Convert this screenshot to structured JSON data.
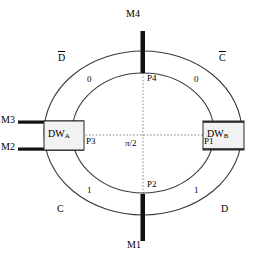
{
  "diagram": {
    "center_label": "π/2",
    "quadrant_labels": [
      {
        "name": "top-left-quadrant-label",
        "text": "D",
        "overline": true
      },
      {
        "name": "top-right-quadrant-label",
        "text": "C",
        "overline": true
      },
      {
        "name": "bottom-left-quadrant-label",
        "text": "C",
        "overline": false
      },
      {
        "name": "bottom-right-quadrant-label",
        "text": "D",
        "overline": false
      }
    ],
    "bit_labels": [
      {
        "name": "bit-top-left",
        "text": "0"
      },
      {
        "name": "bit-top-right",
        "text": "0"
      },
      {
        "name": "bit-bottom-left",
        "text": "1"
      },
      {
        "name": "bit-bottom-right",
        "text": "1"
      }
    ],
    "points": [
      {
        "name": "point-p1",
        "text": "P1"
      },
      {
        "name": "point-p2",
        "text": "P2"
      },
      {
        "name": "point-p3",
        "text": "P3"
      },
      {
        "name": "point-p4",
        "text": "P4"
      }
    ],
    "magnet_labels": [
      {
        "name": "magnet-m1",
        "text": "M1"
      },
      {
        "name": "magnet-m2",
        "text": "M2"
      },
      {
        "name": "magnet-m3",
        "text": "M3"
      },
      {
        "name": "magnet-m4",
        "text": "M4"
      }
    ],
    "domain_walls": [
      {
        "name": "domain-wall-a",
        "prefix": "DW",
        "subscript": "A"
      },
      {
        "name": "domain-wall-b",
        "prefix": "DW",
        "subscript": "B"
      }
    ],
    "colors": {
      "ring_stroke": "#3a3a3a",
      "bar_fill": "#111111",
      "dotted": "#888888",
      "dw_fill": "#f2f2f2",
      "background": "#ffffff"
    }
  }
}
